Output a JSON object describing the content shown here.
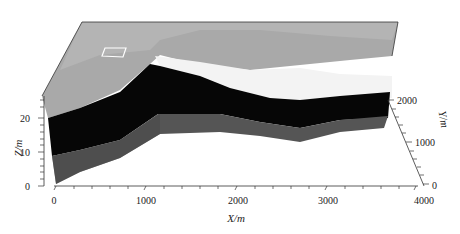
{
  "figure": {
    "type": "3d-geological-block-model",
    "axes": {
      "x": {
        "title": "X/m",
        "ticks": [
          "0",
          "1000",
          "2000",
          "3000",
          "4000"
        ]
      },
      "y": {
        "title": "Y/m",
        "ticks": [
          "0",
          "1000",
          "2000"
        ]
      },
      "z": {
        "title": "Z/m",
        "ticks": [
          "0",
          "10",
          "20"
        ]
      }
    },
    "layers": [
      {
        "name": "top-surface",
        "color": "#a8a8a8"
      },
      {
        "name": "light-layer",
        "color": "#f2f2f2"
      },
      {
        "name": "black-layer",
        "color": "#050505"
      },
      {
        "name": "dark-gray-layer",
        "color": "#555555"
      }
    ],
    "marker": {
      "name": "rectangle-outline",
      "color": "#ffffff"
    }
  }
}
